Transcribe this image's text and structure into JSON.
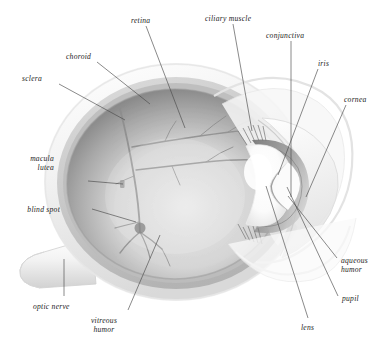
{
  "diagram": {
    "style": "grayscale anatomical illustration",
    "background_color": "#ffffff",
    "label_color": "#1d1d1d",
    "leader_line_color": "#4a4a4a",
    "palette": {
      "sclera": "#f4f4f4",
      "sclera_shadow": "#dcdcdc",
      "choroid": "#c8c8c8",
      "retina_rim": "#9a9a9a",
      "vitreous_light": "#e2e2e2",
      "vitreous_dark": "#8d8d8d",
      "vessel": "#7b7b7b",
      "lens_highlight": "#ffffff",
      "iris_shade": "#8a8a8a",
      "cornea": "#efefef"
    }
  },
  "labels": [
    {
      "id": "retina",
      "text": "retina",
      "lines": [
        "retina"
      ],
      "x": 131,
      "y": 16,
      "align": "left"
    },
    {
      "id": "ciliary-muscle",
      "text": "ciliary muscle",
      "lines": [
        "ciliary muscle"
      ],
      "x": 205,
      "y": 14,
      "align": "left"
    },
    {
      "id": "conjunctiva",
      "text": "conjunctiva",
      "lines": [
        "conjunctiva"
      ],
      "x": 266,
      "y": 31,
      "align": "left"
    },
    {
      "id": "choroid",
      "text": "choroid",
      "lines": [
        "choroid"
      ],
      "x": 66,
      "y": 52,
      "align": "left"
    },
    {
      "id": "iris",
      "text": "iris",
      "lines": [
        "iris"
      ],
      "x": 318,
      "y": 59,
      "align": "left"
    },
    {
      "id": "sclera",
      "text": "sclera",
      "lines": [
        "sclera"
      ],
      "x": 22,
      "y": 74,
      "align": "left"
    },
    {
      "id": "cornea",
      "text": "cornea",
      "lines": [
        "cornea"
      ],
      "x": 344,
      "y": 95,
      "align": "left"
    },
    {
      "id": "macula-lutea",
      "text": "macula lutea",
      "lines": [
        "macula",
        "lutea"
      ],
      "x": 54,
      "y": 154,
      "align": "right"
    },
    {
      "id": "blind-spot",
      "text": "blind spot",
      "lines": [
        "blind spot"
      ],
      "x": 60,
      "y": 205,
      "align": "right"
    },
    {
      "id": "aqueous-humor",
      "text": "aqueous humor",
      "lines": [
        "aqueous",
        "humor"
      ],
      "x": 341,
      "y": 256,
      "align": "left"
    },
    {
      "id": "optic-nerve",
      "text": "optic nerve",
      "lines": [
        "optic nerve"
      ],
      "x": 33,
      "y": 302,
      "align": "left"
    },
    {
      "id": "pupil",
      "text": "pupil",
      "lines": [
        "pupil"
      ],
      "x": 342,
      "y": 294,
      "align": "left"
    },
    {
      "id": "lens",
      "text": "lens",
      "lines": [
        "lens"
      ],
      "x": 301,
      "y": 323,
      "align": "left"
    },
    {
      "id": "vitreous-humor",
      "text": "vitreous humor",
      "lines": [
        "vitreous",
        "humor"
      ],
      "x": 103,
      "y": 316,
      "align": "center"
    }
  ],
  "leader_lines": [
    {
      "id": "retina-leader",
      "from": [
        146,
        26
      ],
      "to": [
        185,
        128
      ]
    },
    {
      "id": "ciliary-muscle-leader",
      "from": [
        233,
        24
      ],
      "to": [
        252,
        131
      ]
    },
    {
      "id": "conjunctiva-leader",
      "from": [
        291,
        41
      ],
      "to": [
        291,
        197
      ]
    },
    {
      "id": "choroid-leader",
      "from": [
        97,
        62
      ],
      "to": [
        150,
        104
      ]
    },
    {
      "id": "iris-leader",
      "from": [
        318,
        69
      ],
      "to": [
        278,
        175
      ]
    },
    {
      "id": "sclera-leader",
      "from": [
        59,
        84
      ],
      "to": [
        125,
        120
      ]
    },
    {
      "id": "cornea-leader",
      "from": [
        346,
        105
      ],
      "to": [
        306,
        197
      ]
    },
    {
      "id": "macula-leader",
      "from": [
        88,
        181
      ],
      "to": [
        123,
        184
      ]
    },
    {
      "id": "blind-spot-leader",
      "from": [
        92,
        209
      ],
      "to": [
        136,
        222
      ]
    },
    {
      "id": "aqueous-leader",
      "from": [
        337,
        258
      ],
      "to": [
        288,
        196
      ]
    },
    {
      "id": "optic-nerve-leader",
      "from": [
        64,
        296
      ],
      "to": [
        64,
        259
      ]
    },
    {
      "id": "pupil-leader",
      "from": [
        338,
        296
      ],
      "to": [
        287,
        187
      ]
    },
    {
      "id": "lens-leader",
      "from": [
        308,
        318
      ],
      "to": [
        266,
        186
      ]
    },
    {
      "id": "vitreous-leader",
      "from": [
        128,
        310
      ],
      "to": [
        160,
        235
      ]
    }
  ]
}
